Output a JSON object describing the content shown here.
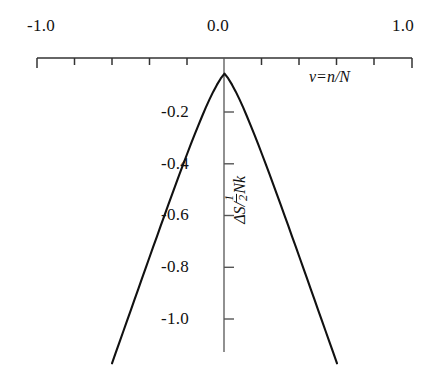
{
  "figure": {
    "background": "#ffffff",
    "line_color": "#111111",
    "axis_color": "#333333"
  },
  "axes": {
    "x": {
      "label_parts": {
        "var": "v",
        "eq": "=",
        "num": "n",
        "slash": "/",
        "den": "N"
      },
      "label_text": "v = n / N",
      "min": -1.0,
      "max": 1.0,
      "tick_labels": [
        "-1.0",
        "0.0",
        "1.0"
      ],
      "tick_label_values": [
        -1.0,
        0.0,
        1.0
      ],
      "minor_tick_values": [
        -0.8,
        -0.6,
        -0.4,
        -0.2,
        0.2,
        0.4,
        0.6,
        0.8
      ],
      "tick_interval": 0.2,
      "position": "top"
    },
    "y": {
      "label_parts": {
        "delta_s": "ΔS/",
        "half_num": "1",
        "half_den": "2",
        "nk": "Nk"
      },
      "label_text": "ΔS/½Nk",
      "tick_labels": [
        "-0.2",
        "-0.4",
        "-0.6",
        "-0.8",
        "-1.0"
      ],
      "tick_label_values": [
        -0.2,
        -0.4,
        -0.6,
        -0.8,
        -1.0
      ],
      "max": 0.0,
      "min_visible": -1.18,
      "tick_interval": 0.2,
      "position": "center"
    }
  },
  "chart_data": {
    "type": "line",
    "title": "",
    "subtitle": "",
    "xlabel": "v = n / N",
    "ylabel": "ΔS/½Nk",
    "xlim": [
      -1.0,
      1.0
    ],
    "ylim": [
      -1.18,
      0.0
    ],
    "grid": false,
    "legend": null,
    "annotations": [],
    "series": [
      {
        "name": "ΔS/½Nk",
        "x": [
          -0.6,
          -0.58,
          -0.56,
          -0.54,
          -0.52,
          -0.5,
          -0.48,
          -0.46,
          -0.44,
          -0.42,
          -0.4,
          -0.38,
          -0.36,
          -0.34,
          -0.32,
          -0.3,
          -0.28,
          -0.26,
          -0.24,
          -0.22,
          -0.2,
          -0.18,
          -0.16,
          -0.14,
          -0.12,
          -0.1,
          -0.08,
          -0.06,
          -0.04,
          -0.02,
          0.0,
          0.02,
          0.04,
          0.06,
          0.08,
          0.1,
          0.12,
          0.14,
          0.16,
          0.18,
          0.2,
          0.22,
          0.24,
          0.26,
          0.28,
          0.3,
          0.32,
          0.34,
          0.36,
          0.38,
          0.4,
          0.42,
          0.44,
          0.46,
          0.48,
          0.5,
          0.52,
          0.54,
          0.56,
          0.58,
          0.6
        ],
        "y": [
          -1.18,
          -1.139,
          -1.098,
          -1.057,
          -1.016,
          -0.975,
          -0.934,
          -0.893,
          -0.852,
          -0.811,
          -0.77,
          -0.729,
          -0.689,
          -0.648,
          -0.608,
          -0.568,
          -0.528,
          -0.488,
          -0.449,
          -0.41,
          -0.372,
          -0.334,
          -0.297,
          -0.261,
          -0.226,
          -0.192,
          -0.16,
          -0.13,
          -0.103,
          -0.079,
          -0.06,
          -0.079,
          -0.103,
          -0.13,
          -0.16,
          -0.192,
          -0.226,
          -0.261,
          -0.297,
          -0.334,
          -0.372,
          -0.41,
          -0.449,
          -0.488,
          -0.528,
          -0.568,
          -0.608,
          -0.648,
          -0.689,
          -0.729,
          -0.77,
          -0.811,
          -0.852,
          -0.893,
          -0.934,
          -0.975,
          -1.016,
          -1.057,
          -1.098,
          -1.139,
          -1.18
        ]
      }
    ]
  }
}
